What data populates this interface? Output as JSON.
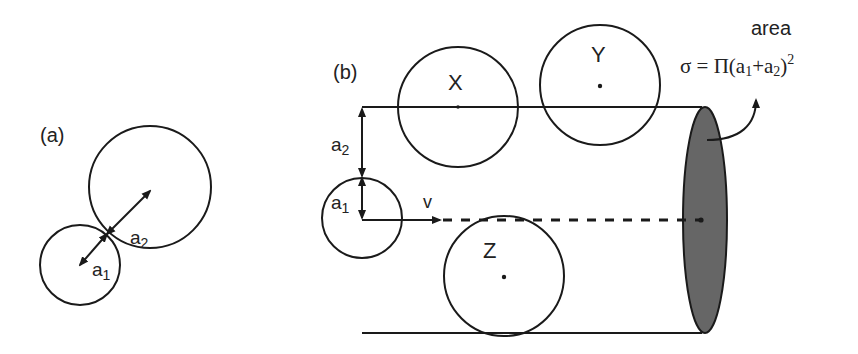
{
  "panel_a": {
    "label": "(a)",
    "radius_large": "a",
    "radius_large_sub": "2",
    "radius_small": "a",
    "radius_small_sub": "1"
  },
  "panel_b": {
    "label": "(b)",
    "spheres": [
      {
        "name": "X"
      },
      {
        "name": "Y"
      },
      {
        "name": "Z"
      }
    ],
    "radius_a2": "a",
    "radius_a2_sub": "2",
    "radius_a1": "a",
    "radius_a1_sub": "1",
    "velocity_label": "v",
    "area_label": "area",
    "formula_prefix": "σ = Π(a",
    "formula_sub1": "1",
    "formula_mid": "+a",
    "formula_sub2": "2",
    "formula_suffix": ")",
    "formula_exp": "2"
  },
  "colors": {
    "stroke": "#1a1a1a",
    "cross_section_fill": "#666666"
  }
}
